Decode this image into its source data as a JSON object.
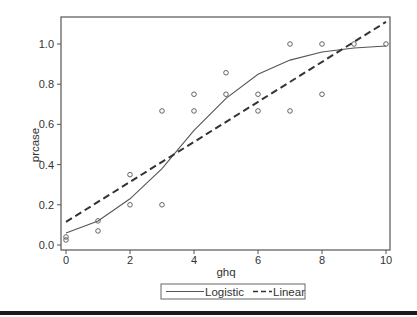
{
  "chart_data": {
    "type": "scatter",
    "title": "",
    "xlabel": "ghq",
    "ylabel": "prcase",
    "xlim": [
      0,
      10
    ],
    "ylim": [
      0,
      1.1
    ],
    "x_ticks": [
      0,
      2,
      4,
      6,
      8,
      10
    ],
    "x_tick_labels": [
      "0",
      "2",
      "4",
      "6",
      "8",
      "10"
    ],
    "y_ticks": [
      0.0,
      0.2,
      0.4,
      0.6,
      0.8,
      1.0
    ],
    "y_tick_labels": [
      "0.0",
      "0.2",
      "0.4",
      "0.6",
      "0.8",
      "1.0"
    ],
    "grid": false,
    "legend_position": "bottom",
    "series": [
      {
        "name": "Observed",
        "type": "scatter",
        "marker": "open-circle",
        "x": [
          0,
          0,
          1,
          1,
          2,
          2,
          3,
          3,
          4,
          4,
          5,
          5,
          6,
          6,
          7,
          7,
          8,
          8,
          9,
          10
        ],
        "y": [
          0.04,
          0.025,
          0.12,
          0.07,
          0.35,
          0.2,
          0.667,
          0.2,
          0.75,
          0.667,
          0.857,
          0.75,
          0.75,
          0.667,
          1.0,
          0.667,
          1.0,
          0.75,
          1.0,
          1.0
        ]
      },
      {
        "name": "Logistic",
        "type": "line",
        "style": "solid",
        "x": [
          0,
          1,
          2,
          3,
          4,
          5,
          6,
          7,
          8,
          9,
          10
        ],
        "y": [
          0.06,
          0.12,
          0.23,
          0.38,
          0.57,
          0.73,
          0.85,
          0.92,
          0.96,
          0.98,
          0.99
        ]
      },
      {
        "name": "Linear",
        "type": "line",
        "style": "dashed",
        "x": [
          0,
          10
        ],
        "y": [
          0.115,
          1.11
        ]
      }
    ],
    "legend": [
      "Logistic",
      "Linear"
    ]
  },
  "colors": {
    "axis": "#555555",
    "logistic": "#555555",
    "linear": "#333333",
    "points": "#555555",
    "rule": "#1a1a1a"
  }
}
